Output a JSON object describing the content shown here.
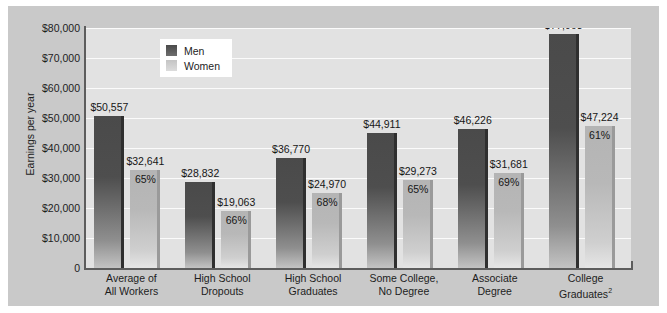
{
  "chart_data": {
    "type": "bar",
    "title": "",
    "xlabel": "",
    "ylabel": "Earnings per year",
    "ylim": [
      0,
      80000
    ],
    "grid": true,
    "legend_position": "top-left-inside",
    "categories": [
      "Average of\nAll Workers",
      "High School\nDropouts",
      "High School\nGraduates",
      "Some College,\nNo Degree",
      "Associate\nDegree",
      "College\nGraduates"
    ],
    "category_lines": [
      [
        "Average of",
        "All Workers",
        ""
      ],
      [
        "High School",
        "Dropouts",
        ""
      ],
      [
        "High School",
        "Graduates",
        ""
      ],
      [
        "Some College,",
        "No Degree",
        ""
      ],
      [
        "Associate",
        "Degree",
        ""
      ],
      [
        "College",
        "Graduates",
        "2"
      ]
    ],
    "series": [
      {
        "name": "Men",
        "color": "#4a4a4a",
        "values": [
          50557,
          28832,
          36770,
          44911,
          46226,
          77963
        ],
        "labels": [
          "$50,557",
          "$28,832",
          "$36,770",
          "$44,911",
          "$46,226",
          "$77,963"
        ]
      },
      {
        "name": "Women",
        "color": "#b8b8b8",
        "values": [
          32641,
          19063,
          24970,
          29273,
          31681,
          47224
        ],
        "labels": [
          "$32,641",
          "$19,063",
          "$24,970",
          "$29,273",
          "$31,681",
          "$47,224"
        ],
        "pct_of_men": [
          "65%",
          "66%",
          "68%",
          "65%",
          "69%",
          "61%"
        ]
      }
    ],
    "yticks": [
      {
        "value": 80000,
        "label": "$80,000"
      },
      {
        "value": 70000,
        "label": "$70,000"
      },
      {
        "value": 60000,
        "label": "$60,000"
      },
      {
        "value": 50000,
        "label": "$50,000"
      },
      {
        "value": 40000,
        "label": "$40,000"
      },
      {
        "value": 30000,
        "label": "$30,000"
      },
      {
        "value": 20000,
        "label": "$20,000"
      },
      {
        "value": 10000,
        "label": "$10,000"
      },
      {
        "value": 0,
        "label": "0"
      }
    ]
  },
  "legend": {
    "items": [
      {
        "label": "Men",
        "key": "men"
      },
      {
        "label": "Women",
        "key": "women"
      }
    ]
  },
  "colors": {
    "panel_background": "#c9c9c9",
    "plot_background": "#e2e2e2",
    "gridline": "#fbfbfb",
    "axis": "#5d5d5d",
    "men_bar": "#4a4a4a",
    "women_bar": "#b8b8b8",
    "text": "#1d1d1d"
  }
}
